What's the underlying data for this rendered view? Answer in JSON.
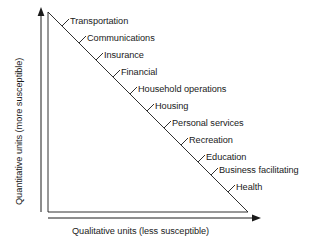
{
  "chart_data": {
    "type": "diagram",
    "diagram_kind": "right-triangle-continuum",
    "title": "",
    "xlabel": "Qualitative units (less susceptible)",
    "ylabel": "Quantitative units (more susceptible)",
    "grid": false,
    "legend": "none",
    "axis_arrows": {
      "y": "up",
      "x": "right"
    },
    "triangle": {
      "apex": [
        48,
        12
      ],
      "origin": [
        48,
        212
      ],
      "right_vertex": [
        248,
        212
      ],
      "hypotenuse_from": [
        48,
        12
      ],
      "hypotenuse_to": [
        248,
        212
      ]
    },
    "categories": [
      "Transportation",
      "Communications",
      "Insurance",
      "Financial",
      "Household operations",
      "Housing",
      "Personal services",
      "Recreation",
      "Education",
      "Business facilitating",
      "Health"
    ],
    "values": [
      1,
      2,
      3,
      4,
      5,
      6,
      7,
      8,
      9,
      10,
      11
    ],
    "annotations": [
      "Tick marks along the hypotenuse mark each service category",
      "Top of the scale is more quantitative and more susceptible",
      "Bottom of the scale is more qualitative and less susceptible"
    ]
  },
  "axes": {
    "y_label": "Quantitative units (more susceptible)",
    "x_label": "Qualitative units (less susceptible)"
  },
  "items": [
    {
      "label": "Transportation",
      "tick_x": 62,
      "tick_y": 26,
      "text_x": 70,
      "text_y": 16
    },
    {
      "label": "Communications",
      "tick_x": 79,
      "tick_y": 43,
      "text_x": 87,
      "text_y": 33
    },
    {
      "label": "Insurance",
      "tick_x": 96,
      "tick_y": 60,
      "text_x": 104,
      "text_y": 50
    },
    {
      "label": "Financial",
      "tick_x": 113,
      "tick_y": 77,
      "text_x": 121,
      "text_y": 67
    },
    {
      "label": "Household operations",
      "tick_x": 130,
      "tick_y": 94,
      "text_x": 138,
      "text_y": 84
    },
    {
      "label": "Housing",
      "tick_x": 147,
      "tick_y": 111,
      "text_x": 155,
      "text_y": 101
    },
    {
      "label": "Personal services",
      "tick_x": 164,
      "tick_y": 128,
      "text_x": 172,
      "text_y": 118
    },
    {
      "label": "Recreation",
      "tick_x": 181,
      "tick_y": 145,
      "text_x": 189,
      "text_y": 135
    },
    {
      "label": "Education",
      "tick_x": 198,
      "tick_y": 162,
      "text_x": 206,
      "text_y": 152
    },
    {
      "label": "Business facilitating",
      "tick_x": 211,
      "tick_y": 175,
      "text_x": 219,
      "text_y": 165
    },
    {
      "label": "Health",
      "tick_x": 228,
      "tick_y": 192,
      "text_x": 236,
      "text_y": 182
    }
  ],
  "colors": {
    "line": "#1a1a1a",
    "text": "#1a1a1a",
    "background": "#ffffff"
  }
}
